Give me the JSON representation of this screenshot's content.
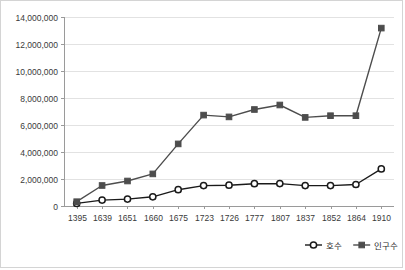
{
  "chart_data": {
    "type": "line",
    "title": "",
    "xlabel": "",
    "ylabel": "",
    "categories": [
      "1395",
      "1639",
      "1651",
      "1660",
      "1675",
      "1723",
      "1726",
      "1777",
      "1807",
      "1837",
      "1852",
      "1864",
      "1910"
    ],
    "ylim": [
      0,
      14000000
    ],
    "y_ticks": [
      0,
      2000000,
      4000000,
      6000000,
      8000000,
      10000000,
      12000000,
      14000000
    ],
    "y_tick_labels": [
      "0",
      "2,000,000",
      "4,000,000",
      "6,000,000",
      "8,000,000",
      "10,000,000",
      "12,000,000",
      "14,000,000"
    ],
    "grid": true,
    "legend_position": "bottom-right",
    "series": [
      {
        "name": "호수",
        "marker": "open-circle",
        "color": "#1a1a1a",
        "values": [
          190000,
          440000,
          510000,
          680000,
          1210000,
          1510000,
          1540000,
          1650000,
          1660000,
          1510000,
          1510000,
          1590000,
          2750000
        ]
      },
      {
        "name": "인구수",
        "marker": "filled-square",
        "color": "#4d4d4d",
        "values": [
          320000,
          1520000,
          1850000,
          2380000,
          4600000,
          6730000,
          6600000,
          7150000,
          7480000,
          6560000,
          6690000,
          6690000,
          13180000
        ]
      }
    ]
  },
  "legend": {
    "items": [
      {
        "label": "호수"
      },
      {
        "label": "인구수"
      }
    ]
  }
}
